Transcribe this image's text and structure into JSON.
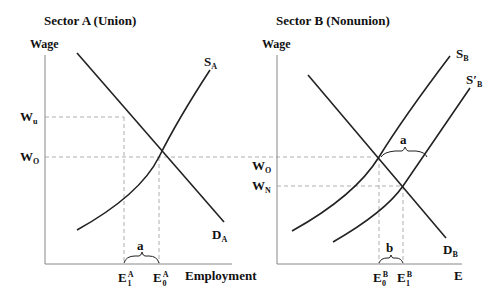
{
  "panels": [
    {
      "title": "Sector A (Union)",
      "y_axis_label": "Wage",
      "x_axis_label": "Employment",
      "wage_labels": {
        "upper": "W",
        "upper_sub": "u",
        "lower": "W",
        "lower_sub": "O"
      },
      "supply_label": {
        "main": "S",
        "sub": "A"
      },
      "demand_label": {
        "main": "D",
        "sub": "A"
      },
      "gap_label": "a",
      "employment_ticks": [
        {
          "main": "E",
          "sub": "1",
          "sup": "A"
        },
        {
          "main": "E",
          "sub": "0",
          "sup": "A"
        }
      ]
    },
    {
      "title": "Sector B (Nonunion)",
      "y_axis_label": "Wage",
      "x_axis_label": "E",
      "wage_labels": {
        "upper": "W",
        "upper_sub": "O",
        "lower": "W",
        "lower_sub": "N"
      },
      "supply_label": {
        "main": "S",
        "sub": "B"
      },
      "supply2_label": {
        "main": "S′",
        "sub": "B"
      },
      "demand_label": {
        "main": "D",
        "sub": "B"
      },
      "shift_label": "a",
      "gap_label": "b",
      "employment_ticks": [
        {
          "main": "E",
          "sub": "0",
          "sup": "B"
        },
        {
          "main": "E",
          "sub": "1",
          "sup": "B"
        }
      ]
    }
  ]
}
